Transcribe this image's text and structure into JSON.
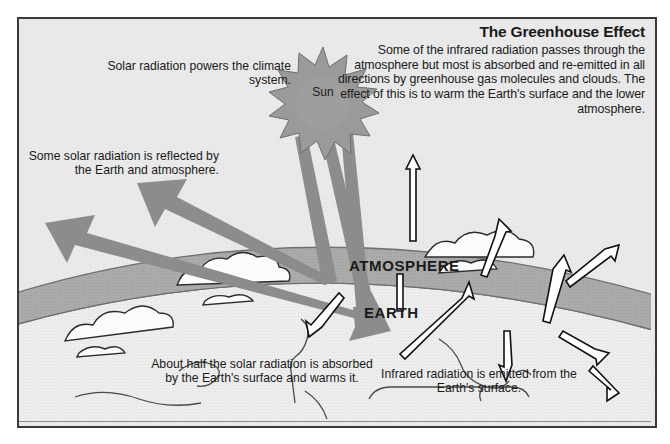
{
  "diagram": {
    "title": "The Greenhouse Effect",
    "intro": "Some of the infrared radiation passes through the atmosphere but most is absorbed and re-emitted in all directions by greenhouse gas molecules and clouds. The effect of this is to warm the Earth's surface and the lower atmosphere.",
    "labels": {
      "sun": "Sun",
      "atmosphere": "ATMOSPHERE",
      "earth": "EARTH"
    },
    "annotations": {
      "solar_powers": "Solar radiation powers the climate system.",
      "reflected": "Some solar radiation is reflected by the Earth and atmosphere.",
      "absorbed": "About half the solar radiation is absorbed by the Earth's surface and warms it.",
      "emitted": "Infrared radiation is emitted from the Earth's surface."
    },
    "colors": {
      "background": "#e9e9e9",
      "frame_border": "#3a3a3a",
      "atmosphere_band": "#ababab",
      "earth_surface": "#ededed",
      "solar_arrow": "#8c8c8c",
      "infrared_arrow_fill": "#ffffff",
      "infrared_arrow_stroke": "#111111",
      "sun_fill": "#9a9a9a",
      "cloud_fill": "#fbfbfb",
      "text": "#1a1a1a"
    },
    "icons": {
      "sun": "sun-starburst-icon",
      "solar_ray": "solar-ray-arrow-icon",
      "infrared_ray": "infrared-ray-arrow-icon",
      "cloud": "cloud-icon"
    }
  }
}
